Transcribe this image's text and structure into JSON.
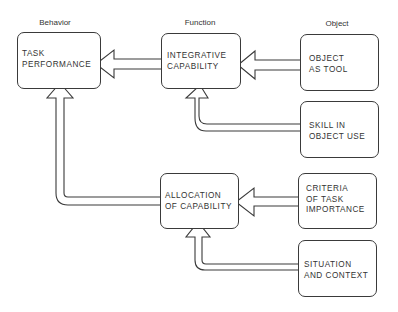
{
  "columns": {
    "behavior": "Behavior",
    "function": "Function",
    "object": "Object"
  },
  "nodes": {
    "task_performance": {
      "line1": "TASK",
      "line2": "PERFORMANCE"
    },
    "integrative_capability": {
      "line1": "INTEGRATIVE",
      "line2": "CAPABILITY"
    },
    "object_as_tool": {
      "line1": "OBJECT",
      "line2": "AS TOOL"
    },
    "skill_in_object_use": {
      "line1": "SKILL IN",
      "line2": "OBJECT USE"
    },
    "allocation_of_capability": {
      "line1": "ALLOCATION",
      "line2": "OF CAPABILITY"
    },
    "criteria_of_task_importance": {
      "line1": "CRITERIA",
      "line2": "OF TASK",
      "line3": "IMPORTANCE"
    },
    "situation_and_context": {
      "line1": "SITUATION",
      "line2": "AND CONTEXT"
    }
  },
  "edges": [
    {
      "from": "integrative_capability",
      "to": "task_performance"
    },
    {
      "from": "object_as_tool",
      "to": "integrative_capability"
    },
    {
      "from": "skill_in_object_use",
      "to": "integrative_capability"
    },
    {
      "from": "allocation_of_capability",
      "to": "task_performance"
    },
    {
      "from": "criteria_of_task_importance",
      "to": "allocation_of_capability"
    },
    {
      "from": "situation_and_context",
      "to": "allocation_of_capability"
    }
  ],
  "colors": {
    "stroke": "#3a3a3a",
    "background": "#ffffff",
    "text": "#333333"
  }
}
